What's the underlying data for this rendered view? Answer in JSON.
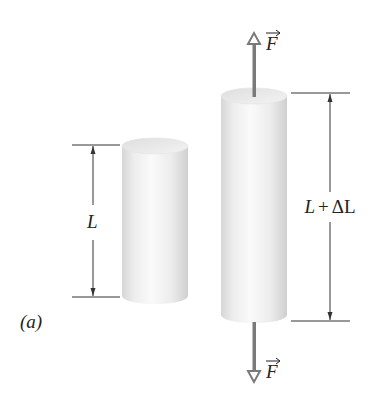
{
  "figure": {
    "panel_label": "(a)",
    "colors": {
      "cylinder_light": "#f4f4f4",
      "cylinder_shade": "#d2d2d2",
      "force_arrow": "#7a7a7a",
      "dimension_line": "#333333",
      "text": "#222222"
    },
    "short_cylinder": {
      "length_label": "L"
    },
    "long_cylinder": {
      "length_label": "L + ΔL",
      "label_L": "L",
      "label_plus": "+",
      "label_delta": "ΔL"
    },
    "forces": {
      "top": {
        "symbol": "F",
        "vector_arrow": "→",
        "direction": "up"
      },
      "bottom": {
        "symbol": "F",
        "vector_arrow": "→",
        "direction": "down"
      }
    }
  }
}
